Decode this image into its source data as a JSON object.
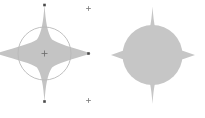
{
  "canvas": {
    "label": "vector-shape-canvas",
    "width": 205,
    "height": 118,
    "background_color": "#ffffff"
  },
  "palette": {
    "shape_fill": "#c4c4c4",
    "shape_fill_alt": "#c6c6c6",
    "overlay_stroke": "#b9b9b9",
    "handle_color": "#4a4a4a",
    "canvas_background": "#ffffff"
  },
  "objects": [
    {
      "id": "left-star",
      "name": "four-point-star-left",
      "type": "star",
      "points": 4,
      "fill": "#c4c4c4",
      "center": {
        "x": 44.5,
        "y": 53.5
      },
      "outer_radius_x": 46,
      "outer_radius_y": 49,
      "inner_ratio": 0.3,
      "selected": true,
      "clipped_left_edge": true
    },
    {
      "id": "left-overlay-circle",
      "name": "selection-circle-overlay",
      "type": "circle",
      "stroke": "#b9b9b9",
      "stroke_width": 0.9,
      "fill": "none",
      "center": {
        "x": 44.5,
        "y": 53.5
      },
      "radius": 26.5
    },
    {
      "id": "right-shape",
      "name": "four-point-star-union-circle",
      "type": "union",
      "components": [
        "star",
        "circle"
      ],
      "points": 4,
      "fill": "#c6c6c6",
      "center": {
        "x": 152.5,
        "y": 55
      },
      "outer_radius_x": 41,
      "outer_radius_y": 48,
      "inner_ratio": 0.3,
      "circle_radius": 30,
      "selected": false
    }
  ],
  "handles": [
    {
      "name": "handle-top",
      "x": 44.5,
      "y": 5,
      "shape": "square",
      "size": 2.6,
      "color": "#4a4a4a"
    },
    {
      "name": "handle-bottom",
      "x": 44.5,
      "y": 101.5,
      "shape": "square",
      "size": 2.6,
      "color": "#4a4a4a"
    },
    {
      "name": "handle-right",
      "x": 88.5,
      "y": 53.5,
      "shape": "square",
      "size": 2.6,
      "color": "#4a4a4a"
    },
    {
      "name": "handle-center",
      "x": 44.5,
      "y": 53.5,
      "shape": "cross",
      "size": 3.0,
      "color": "#6e6e6e"
    },
    {
      "name": "handle-anchor-top-right",
      "x": 88.5,
      "y": 8.5,
      "shape": "cross",
      "size": 2.4,
      "color": "#7a7a7a"
    },
    {
      "name": "handle-anchor-bottom-right",
      "x": 88.5,
      "y": 100.5,
      "shape": "cross",
      "size": 2.4,
      "color": "#7a7a7a"
    }
  ],
  "geometry": {
    "left_star_path": "M 44.5 4.5 L 52.5 39.5 L 91.0 53.5 L 52.5 67.5 L 44.5 102.5 L 36.5 67.5 L -4.0 53.5 L 36.5 39.5 Z",
    "right_star_path": "M 152.5 6.5 L 161.0 41.5 L 195.0 55.0 L 161.0 68.5 L 152.5 104.0 L 144.0 68.5 L 111.0 55.0 L 144.0 41.5 Z"
  }
}
